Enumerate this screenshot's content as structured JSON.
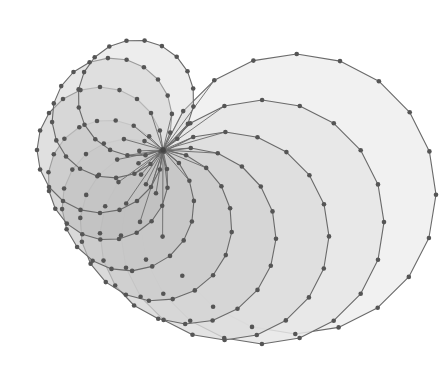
{
  "figure": {
    "width": 443,
    "height": 381,
    "shared_vertex": [
      163,
      150
    ],
    "sides": 20,
    "stroke_color": "#6a6a6a",
    "vertex_color": "#555555",
    "vertex_radius": 2.3,
    "polygons": [
      {
        "cx": 296,
        "cy": 194,
        "r": 140,
        "fill": "#efefef",
        "opacity": 0.9
      },
      {
        "cx": 262,
        "cy": 222,
        "r": 122,
        "fill": "#e6e6e6",
        "opacity": 0.85
      },
      {
        "cx": 225,
        "cy": 236,
        "r": 104,
        "fill": "#dcdcdc",
        "opacity": 0.8
      },
      {
        "cx": 188,
        "cy": 236,
        "r": 88,
        "fill": "#d3d3d3",
        "opacity": 0.75
      },
      {
        "cx": 156,
        "cy": 225,
        "r": 76,
        "fill": "#cbcbcb",
        "opacity": 0.7
      },
      {
        "cx": 128,
        "cy": 205,
        "r": 66,
        "fill": "#c4c4c4",
        "opacity": 0.65
      },
      {
        "cx": 108,
        "cy": 180,
        "r": 60,
        "fill": "#bdbdbd",
        "opacity": 0.6
      },
      {
        "cx": 100,
        "cy": 150,
        "r": 63,
        "fill": "#c6c6c6",
        "opacity": 0.55
      },
      {
        "cx": 112,
        "cy": 118,
        "r": 60,
        "fill": "#cecece",
        "opacity": 0.5
      },
      {
        "cx": 136,
        "cy": 98,
        "r": 58,
        "fill": "#d6d6d6",
        "opacity": 0.45
      }
    ],
    "caption": ""
  }
}
